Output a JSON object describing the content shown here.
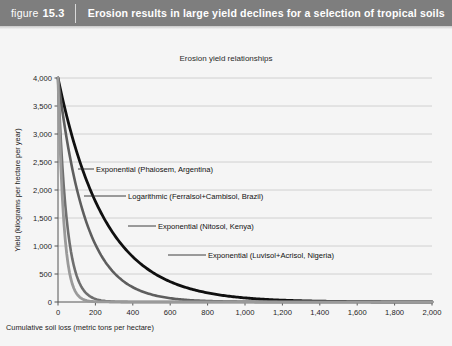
{
  "header": {
    "figure_word": "figure",
    "figure_number": "15.3",
    "title": "Erosion results in large yield declines for a selection of tropical soils",
    "background_color": "#7e7e7e",
    "text_color": "#ffffff"
  },
  "chart_data": {
    "type": "line",
    "title": "Erosion yield relationships",
    "xlabel": "Cumulative soil loss (metric tons per hectare)",
    "ylabel": "Yield (kilograms per hectare per year)",
    "xlim": [
      0,
      2000
    ],
    "ylim": [
      0,
      4000
    ],
    "xticks": [
      0,
      200,
      400,
      600,
      800,
      1000,
      1200,
      1400,
      1600,
      1800,
      2000
    ],
    "xtick_labels": [
      "0",
      "200",
      "400",
      "600",
      "800",
      "1,000",
      "1,200",
      "1,400",
      "1,600",
      "1,800",
      "2,000"
    ],
    "yticks": [
      0,
      500,
      1000,
      1500,
      2000,
      2500,
      3000,
      3500,
      4000
    ],
    "ytick_labels": [
      "0",
      "500",
      "1,000",
      "1,500",
      "2,000",
      "2,500",
      "3,000",
      "3,500",
      "4,000"
    ],
    "grid": "horizontal",
    "legend": "annotations",
    "series": [
      {
        "name": "Exponential (Phaiosem, Argentina)",
        "label": "Exponential (Phaiosem, Argentina)",
        "color": "#6f6f6f",
        "width": 2.6,
        "model": "exponential",
        "y0": 4000,
        "decay": 0.0215,
        "floor": 0,
        "x_end": 2000,
        "label_x": 96,
        "label_y": 172,
        "leader_from_x": 78,
        "leader_from_y": 169,
        "leader_to_x": 94,
        "leader_to_y": 169
      },
      {
        "name": "Logarithmic (Ferralsol+Cambisol, Brazil)",
        "label": "Logarithmic (Ferralsol+Cambisol, Brazil)",
        "color": "#101010",
        "width": 2.8,
        "model": "exponential",
        "y0": 4000,
        "decay": 0.004,
        "floor": 0,
        "x_end": 2000,
        "label_x": 128,
        "label_y": 199,
        "leader_from_x": 84,
        "leader_from_y": 196,
        "leader_to_x": 126,
        "leader_to_y": 196
      },
      {
        "name": "Exponential (Nitosol, Kenya)",
        "label": "Exponential (Nitosol, Kenya)",
        "color": "#5e5e5e",
        "width": 2.6,
        "model": "exponential",
        "y0": 4000,
        "decay": 0.0068,
        "floor": 0,
        "x_end": 2000,
        "label_x": 158,
        "label_y": 229,
        "leader_from_x": 128,
        "leader_from_y": 226,
        "leader_to_x": 156,
        "leader_to_y": 226
      },
      {
        "name": "Exponential (Luvisol+Acrisol, Nigeria)",
        "label": "Exponential (Luvisol+Acrisol, Nigeria)",
        "color": "#9a9a9a",
        "width": 2.8,
        "model": "exponential",
        "y0": 4000,
        "decay": 0.033,
        "floor": 0,
        "x_end": 2000,
        "label_x": 208,
        "label_y": 258,
        "leader_from_x": 168,
        "leader_from_y": 255,
        "leader_to_x": 206,
        "leader_to_y": 255
      }
    ],
    "plot_box": {
      "left": 58,
      "top": 78,
      "right": 432,
      "bottom": 302
    },
    "axis_color": "#555555",
    "grid_color": "#c6c6c6",
    "background_color": "#f5f5f5"
  }
}
